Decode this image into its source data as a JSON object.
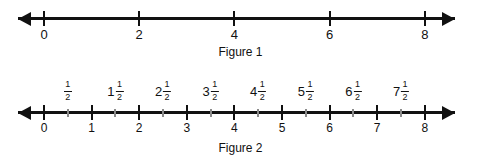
{
  "figures": [
    {
      "id": "figure-1",
      "caption": "Figure 1",
      "axis": {
        "min": 0,
        "max": 8,
        "left_arrow": true,
        "right_arrow": true
      },
      "ticks": [
        {
          "value": 0,
          "label": "0",
          "type": "major"
        },
        {
          "value": 2,
          "label": "2",
          "type": "major"
        },
        {
          "value": 4,
          "label": "4",
          "type": "major"
        },
        {
          "value": 6,
          "label": "6",
          "type": "major"
        },
        {
          "value": 8,
          "label": "8",
          "type": "major"
        }
      ]
    },
    {
      "id": "figure-2",
      "caption": "Figure 2",
      "axis": {
        "min": 0,
        "max": 8,
        "left_arrow": true,
        "right_arrow": true
      },
      "ticks": [
        {
          "value": 0,
          "label": "0",
          "type": "major"
        },
        {
          "value": 0.5,
          "label": "",
          "type": "minor"
        },
        {
          "value": 1,
          "label": "1",
          "type": "major"
        },
        {
          "value": 1.5,
          "label": "",
          "type": "minor"
        },
        {
          "value": 2,
          "label": "2",
          "type": "major"
        },
        {
          "value": 2.5,
          "label": "",
          "type": "minor"
        },
        {
          "value": 3,
          "label": "3",
          "type": "major"
        },
        {
          "value": 3.5,
          "label": "",
          "type": "minor"
        },
        {
          "value": 4,
          "label": "4",
          "type": "major"
        },
        {
          "value": 4.5,
          "label": "",
          "type": "minor"
        },
        {
          "value": 5,
          "label": "5",
          "type": "major"
        },
        {
          "value": 5.5,
          "label": "",
          "type": "minor"
        },
        {
          "value": 6,
          "label": "6",
          "type": "major"
        },
        {
          "value": 6.5,
          "label": "",
          "type": "minor"
        },
        {
          "value": 7,
          "label": "7",
          "type": "major"
        },
        {
          "value": 7.5,
          "label": "",
          "type": "minor"
        },
        {
          "value": 8,
          "label": "8",
          "type": "major"
        }
      ],
      "fraction_labels": [
        {
          "value": 0.5,
          "whole": "",
          "numerator": "1",
          "denominator": "2",
          "text": "1/2"
        },
        {
          "value": 1.5,
          "whole": "1",
          "numerator": "1",
          "denominator": "2",
          "text": "1 1/2"
        },
        {
          "value": 2.5,
          "whole": "2",
          "numerator": "1",
          "denominator": "2",
          "text": "2 1/2"
        },
        {
          "value": 3.5,
          "whole": "3",
          "numerator": "1",
          "denominator": "2",
          "text": "3 1/2"
        },
        {
          "value": 4.5,
          "whole": "4",
          "numerator": "1",
          "denominator": "2",
          "text": "4 1/2"
        },
        {
          "value": 5.5,
          "whole": "5",
          "numerator": "1",
          "denominator": "2",
          "text": "5 1/2"
        },
        {
          "value": 6.5,
          "whole": "6",
          "numerator": "1",
          "denominator": "2",
          "text": "6 1/2"
        },
        {
          "value": 7.5,
          "whole": "7",
          "numerator": "1",
          "denominator": "2",
          "text": "7 1/2"
        }
      ]
    }
  ],
  "geometry": {
    "x_at_zero": 44,
    "unit_px": 47.6,
    "arrow_left_tip": 18,
    "arrow_right_tip": 455
  },
  "colors": {
    "ink": "#111111",
    "minor_tick": "#8a8a8a",
    "background": "#ffffff"
  }
}
